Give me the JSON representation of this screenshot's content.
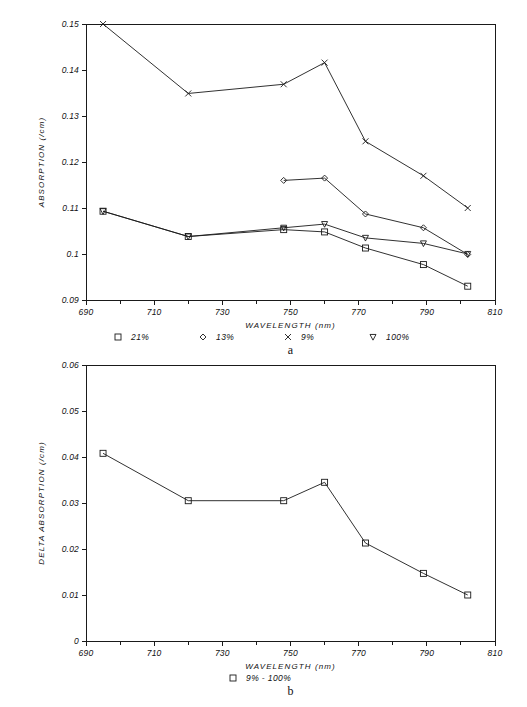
{
  "figure": {
    "background": "#ffffff",
    "ink_color": "#1a1a1a"
  },
  "chart_data": [
    {
      "id": "panel-a",
      "type": "line",
      "title": "",
      "panel_label": "a",
      "xlabel": "WAVELENGTH (nm)",
      "ylabel": "ABSORPTION (/cm)",
      "xlim": [
        690,
        810
      ],
      "ylim": [
        0.09,
        0.15
      ],
      "xticks": [
        690,
        710,
        730,
        750,
        770,
        790,
        810
      ],
      "xtick_labels": [
        "690",
        "710",
        "730",
        "750",
        "770",
        "790",
        "810"
      ],
      "xminor": [
        700,
        720,
        740,
        760,
        780,
        800
      ],
      "yticks": [
        0.09,
        0.1,
        0.11,
        0.12,
        0.13,
        0.14,
        0.15
      ],
      "ytick_labels": [
        "0.09",
        "0.1",
        "0.11",
        "0.12",
        "0.13",
        "0.14",
        "0.15"
      ],
      "grid": false,
      "legend_position": "below-axis",
      "series": [
        {
          "name": "21%",
          "marker": "square",
          "x": [
            695,
            720,
            748,
            760,
            772,
            789,
            802
          ],
          "values": [
            0.1093,
            0.1038,
            0.1053,
            0.1048,
            0.1013,
            0.0977,
            0.093
          ]
        },
        {
          "name": "13%",
          "marker": "diamond",
          "x": [
            748,
            760,
            772,
            789,
            802
          ],
          "values": [
            0.116,
            0.1165,
            0.1087,
            0.1057,
            0.0999
          ]
        },
        {
          "name": "9%",
          "marker": "cross",
          "x": [
            695,
            720,
            748,
            760,
            772,
            789,
            802
          ],
          "values": [
            0.15,
            0.1349,
            0.1369,
            0.1416,
            0.1245,
            0.117,
            0.11
          ]
        },
        {
          "name": "100%",
          "marker": "triangle-down",
          "x": [
            695,
            720,
            748,
            760,
            772,
            789,
            802
          ],
          "values": [
            0.1093,
            0.1038,
            0.1057,
            0.1065,
            0.1035,
            0.1023,
            0.1
          ]
        }
      ]
    },
    {
      "id": "panel-b",
      "type": "line",
      "title": "",
      "panel_label": "b",
      "xlabel": "WAVELENGTH (nm)",
      "ylabel": "DELTA ABSORPTION (/cm)",
      "xlim": [
        690,
        810
      ],
      "ylim": [
        0,
        0.06
      ],
      "xticks": [
        690,
        710,
        730,
        750,
        770,
        790,
        810
      ],
      "xtick_labels": [
        "690",
        "710",
        "730",
        "750",
        "770",
        "790",
        "810"
      ],
      "xminor": [
        700,
        720,
        740,
        760,
        780,
        800
      ],
      "yticks": [
        0,
        0.01,
        0.02,
        0.03,
        0.04,
        0.05,
        0.06
      ],
      "ytick_labels": [
        "0",
        "0.01",
        "0.02",
        "0.03",
        "0.04",
        "0.05",
        "0.06"
      ],
      "grid": false,
      "legend_position": "below-axis",
      "series": [
        {
          "name": "9% - 100%",
          "marker": "square",
          "x": [
            695,
            720,
            748,
            760,
            772,
            789,
            802
          ],
          "values": [
            0.0408,
            0.0305,
            0.0305,
            0.0345,
            0.0213,
            0.0147,
            0.01
          ]
        }
      ]
    }
  ],
  "panel_a": {
    "ylabel": "ABSORPTION (/cm)",
    "xlabel": "WAVELENGTH (nm)",
    "label": "a",
    "legend": [
      {
        "marker": "square",
        "label": "21%"
      },
      {
        "marker": "diamond",
        "label": "13%"
      },
      {
        "marker": "cross",
        "label": "9%"
      },
      {
        "marker": "triangle-down",
        "label": "100%"
      }
    ]
  },
  "panel_b": {
    "ylabel": "DELTA ABSORPTION (/cm)",
    "xlabel": "WAVELENGTH (nm)",
    "label": "b",
    "legend": [
      {
        "marker": "square",
        "label": "9% - 100%"
      }
    ]
  }
}
